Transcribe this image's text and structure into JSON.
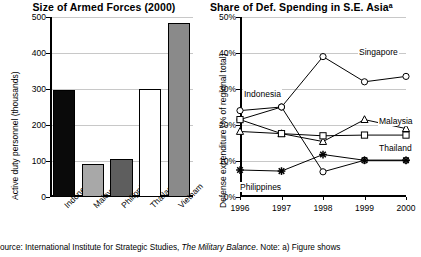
{
  "source_note": {
    "prefix": "ource: International Institute for Strategic Studies, ",
    "italic": "The Military Balance",
    "suffix": ". Note: a) Figure shows"
  },
  "chart_data": [
    {
      "type": "bar",
      "title": "Size of Armed Forces (2000)",
      "xlabel": "",
      "ylabel": "Active duty personnel (thousands)",
      "ylim": [
        0,
        500
      ],
      "yticks": [
        0,
        100,
        200,
        300,
        400,
        500
      ],
      "ytick_labels": [
        "0",
        "100",
        "200",
        "300",
        "400",
        "500"
      ],
      "grid": true,
      "categories": [
        "Indonesia",
        "Malaysia",
        "Philippines",
        "Thailand",
        "Vietnam"
      ],
      "values": [
        298,
        93,
        106,
        301,
        484
      ],
      "bar_colors": [
        "#0a0a0a",
        "#a8a8a8",
        "#5e5e5e",
        "#ffffff",
        "#8a8a8a"
      ]
    },
    {
      "type": "line",
      "title": "Share of Def. Spending in S.E. Asiaᵃ",
      "xlabel": "",
      "ylabel": "Defense expenditure (% of regional total)",
      "ylim": [
        0,
        50
      ],
      "yticks": [
        0,
        10,
        20,
        30,
        40,
        50
      ],
      "ytick_labels": [
        "0%",
        "10%",
        "20%",
        "30%",
        "40%",
        "50%"
      ],
      "grid": true,
      "x": [
        "1996",
        "1997",
        "1998",
        "1999",
        "2000"
      ],
      "legend_position": "inline-annotations",
      "series": [
        {
          "name": "Singapore",
          "marker": "circle",
          "values": [
            21.5,
            25.0,
            39.0,
            32.0,
            33.5
          ]
        },
        {
          "name": "Indonesia",
          "marker": "circle",
          "values": [
            24.0,
            25.0,
            7.0,
            10.2,
            10.2
          ]
        },
        {
          "name": "Malaysia",
          "marker": "triangle",
          "values": [
            18.2,
            17.6,
            15.4,
            21.5,
            19.0
          ]
        },
        {
          "name": "Thailand",
          "marker": "square",
          "values": [
            21.5,
            17.6,
            17.0,
            17.2,
            17.2
          ]
        },
        {
          "name": "Philippines",
          "marker": "star",
          "values": [
            7.5,
            7.2,
            11.8,
            10.2,
            10.2
          ]
        }
      ],
      "annotations": [
        {
          "text": "Singapore",
          "x": 358,
          "y": 47
        },
        {
          "text": "Indonesia",
          "x": 243,
          "y": 89
        },
        {
          "text": "Malaysia",
          "x": 378,
          "y": 116
        },
        {
          "text": "Thailand",
          "x": 378,
          "y": 143
        },
        {
          "text": "Philippines",
          "x": 239,
          "y": 182
        }
      ]
    }
  ]
}
